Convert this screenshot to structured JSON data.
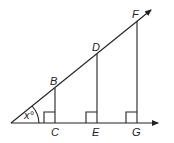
{
  "diagram": {
    "type": "geometry-similar-right-triangles",
    "angle_label": "x°",
    "points": {
      "B": "B",
      "C": "C",
      "D": "D",
      "E": "E",
      "F": "F",
      "G": "G"
    }
  }
}
